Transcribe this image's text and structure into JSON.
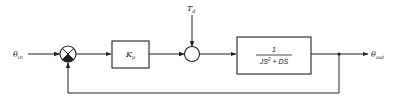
{
  "diagram": {
    "type": "block-diagram",
    "input": {
      "symbol": "θ",
      "subscript": "in"
    },
    "output": {
      "symbol": "θ",
      "subscript": "out"
    },
    "disturbance": {
      "symbol": "T",
      "subscript": "d"
    },
    "controller": {
      "symbol": "K",
      "subscript": "p"
    },
    "plant": {
      "numerator": "1",
      "denominator_a": "JS",
      "denominator_exp": "2",
      "denominator_b": " + DS"
    },
    "summing_junctions": [
      {
        "id": "error",
        "inputs": [
          "+θin",
          "-feedback"
        ]
      },
      {
        "id": "disturbance",
        "inputs": [
          "controller",
          "Td"
        ]
      }
    ],
    "feedback": "unity negative"
  }
}
